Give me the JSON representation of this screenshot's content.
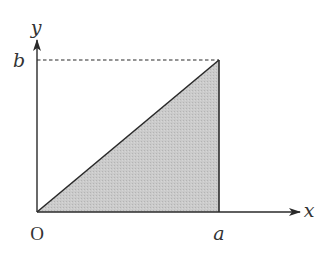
{
  "diagram": {
    "type": "coordinate-region",
    "axes": {
      "x_label": "x",
      "y_label": "y",
      "origin_label": "O"
    },
    "points": {
      "a_label": "a",
      "b_label": "b"
    },
    "region": {
      "vertices": [
        "O",
        "(a, 0)",
        "(a, b)"
      ],
      "fill_color": "#c9c9c9"
    },
    "guide_line": {
      "from": "(0, b)",
      "to": "(a, b)",
      "style": "dashed"
    },
    "colors": {
      "stroke": "#2a2a2a",
      "fill": "#c9c9c9",
      "background": "#ffffff"
    }
  }
}
